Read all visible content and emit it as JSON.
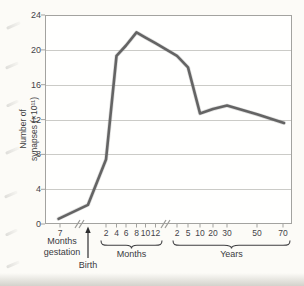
{
  "figure": {
    "y_axis": {
      "label_line1": "Number of",
      "label_line2": "synapses (×10¹¹)",
      "ticks": [
        "24",
        "20",
        "16",
        "12",
        "8",
        "4",
        "0"
      ]
    },
    "x_axis": {
      "gestation_tick": "7",
      "gestation_label_line1": "Months",
      "gestation_label_line2": "gestation",
      "birth_label": "Birth",
      "months_ticks": [
        "2",
        "4",
        "6",
        "8",
        "10",
        "12"
      ],
      "months_group_label": "Months",
      "years_ticks": [
        "2",
        "5",
        "10",
        "20",
        "30",
        "50",
        "70"
      ],
      "years_group_label": "Years"
    }
  },
  "chart_data": {
    "type": "line",
    "title": "",
    "xlabel": "Age (months gestation / months / years, broken axis)",
    "ylabel": "Number of synapses (×10¹¹)",
    "ylim": [
      0,
      24
    ],
    "grid": "horizontal gridlines every 4 units",
    "legend": "none",
    "x_categories": [
      "7 months gestation",
      "Birth",
      "2 months",
      "4 months",
      "6 months",
      "8 months",
      "10 months",
      "12 months",
      "2 years",
      "5 years",
      "10 years",
      "20 years",
      "30 years",
      "50 years",
      "70 years"
    ],
    "values": [
      0.6,
      2.2,
      7.4,
      19.3,
      20.5,
      22,
      21.4,
      20.8,
      19.3,
      18,
      12.7,
      13.2,
      13.6,
      12.6,
      11.6
    ],
    "x_px": [
      58.5,
      88,
      106,
      116.5,
      126,
      136.5,
      145.5,
      155,
      177,
      188,
      200,
      213,
      227,
      257,
      284
    ],
    "colors": {
      "line": "#646464",
      "grid": "#cbcbc7",
      "axis": "#a3a3a0",
      "text": "#3f3f42"
    }
  }
}
